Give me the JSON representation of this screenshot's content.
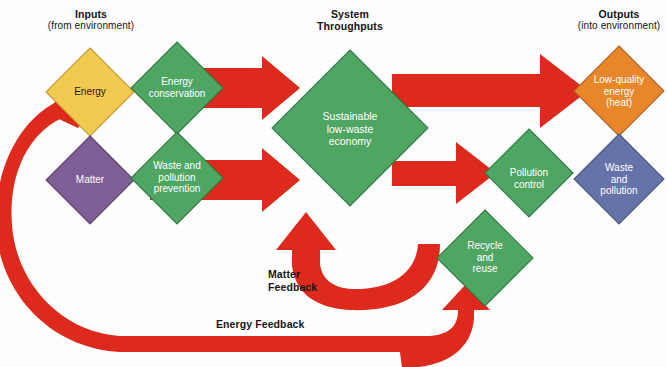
{
  "figure": {
    "background_color": "#fefefe"
  },
  "headings": [
    {
      "id": "inputs",
      "title": "Inputs",
      "subtitle": "(from environment)"
    },
    {
      "id": "throughputs",
      "title": "System",
      "subtitle": "Throughputs",
      "subtitle_bold": true
    },
    {
      "id": "outputs",
      "title": "Outputs",
      "subtitle": "(into environment)"
    }
  ],
  "nodes": [
    {
      "id": "energy",
      "label": "Energy",
      "color": "#f2ca4f",
      "text_color": "#1a1a1a",
      "cx": 90,
      "cy": 92,
      "r": 44
    },
    {
      "id": "matter",
      "label": "Matter",
      "color": "#7e5e95",
      "text_color": "#ffffff",
      "cx": 90,
      "cy": 180,
      "r": 44
    },
    {
      "id": "energy-conservation",
      "label": "Energy\nconservation",
      "color": "#4fa662",
      "text_color": "#ffffff",
      "cx": 177,
      "cy": 88,
      "r": 46
    },
    {
      "id": "waste-pollution-prevention",
      "label": "Waste and\npollution\nprevention",
      "color": "#4fa662",
      "text_color": "#ffffff",
      "cx": 177,
      "cy": 178,
      "r": 46
    },
    {
      "id": "sustainable-economy",
      "label": "Sustainable\nlow-waste\neconomy",
      "color": "#4fa662",
      "text_color": "#ffffff",
      "cx": 350,
      "cy": 128,
      "r": 78
    },
    {
      "id": "pollution-control",
      "label": "Pollution\ncontrol",
      "color": "#4fa662",
      "text_color": "#ffffff",
      "cx": 529,
      "cy": 173,
      "r": 44
    },
    {
      "id": "recycle-reuse",
      "label": "Recycle\nand\nreuse",
      "color": "#4fa662",
      "text_color": "#ffffff",
      "cx": 485,
      "cy": 258,
      "r": 48
    },
    {
      "id": "low-quality-energy",
      "label": "Low-quality\nenergy\n(heat)",
      "color": "#e8862a",
      "text_color": "#ffffff",
      "cx": 619,
      "cy": 91,
      "r": 45
    },
    {
      "id": "waste-and-pollution",
      "label": "Waste\nand\npollution",
      "color": "#6673a8",
      "text_color": "#ffffff",
      "cx": 619,
      "cy": 179,
      "r": 45
    }
  ],
  "arrows": {
    "color": "#dd2a1c",
    "items": [
      {
        "id": "energy-to-throughput",
        "from": "energy-conservation",
        "to": "sustainable-economy"
      },
      {
        "id": "matter-to-throughput",
        "from": "waste-pollution-prevention",
        "to": "sustainable-economy"
      },
      {
        "id": "throughput-to-low-quality-energy",
        "from": "sustainable-economy",
        "to": "low-quality-energy"
      },
      {
        "id": "throughput-to-pollution-control",
        "from": "sustainable-economy",
        "to": "pollution-control"
      },
      {
        "id": "matter-feedback-loop",
        "from": "recycle-reuse",
        "to": "sustainable-economy"
      },
      {
        "id": "energy-feedback-loop",
        "from": "recycle-reuse",
        "to": "energy"
      }
    ]
  },
  "feedback_labels": [
    {
      "id": "matter-feedback",
      "text": "Matter\nFeedback",
      "line1": "Matter",
      "line2": "Feedback"
    },
    {
      "id": "energy-feedback",
      "text": "Energy Feedback",
      "line1": "Energy Feedback",
      "line2": ""
    }
  ],
  "colors": {
    "arrow_red": "#dd2a1c",
    "green": "#4fa662",
    "yellow": "#f2ca4f",
    "purple": "#7e5e95",
    "orange": "#e8862a",
    "blue": "#6673a8",
    "outline": "#b0622a",
    "text_dark": "#141414",
    "text_light": "#ffffff"
  }
}
